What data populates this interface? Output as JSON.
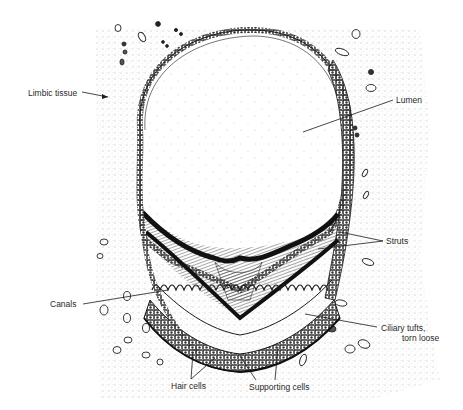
{
  "diagram": {
    "labels": {
      "limbic_tissue": "Limbic tissue",
      "lumen": "Lumen",
      "struts": "Struts",
      "canals": "Canals",
      "ciliary_tufts_line1": "Ciliary tufts,",
      "ciliary_tufts_line2": "torn loose",
      "hair_cells": "Hair cells",
      "supporting_cells": "Supporting cells"
    },
    "colors": {
      "ink": "#1a1a1a",
      "stipple": "#8a8a8a",
      "background": "#ffffff",
      "lumen_fill": "#ffffff"
    }
  }
}
